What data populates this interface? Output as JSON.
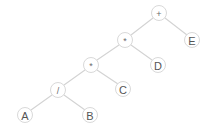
{
  "figure": {
    "kind": "expression-binary-tree",
    "background_color": "#ffffff",
    "edge_color": "#d3d3d3",
    "node_stroke_color": "#d9d9d9",
    "node_fill_color": "#ffffff",
    "label_color": "#5a5a5a",
    "width": 208,
    "height": 132
  },
  "nodes": [
    {
      "id": "n0",
      "label": "+",
      "type": "operator",
      "x": 159,
      "y": 13,
      "r": 7.5
    },
    {
      "id": "n1",
      "label": "*",
      "type": "operator",
      "x": 125,
      "y": 40,
      "r": 7.5
    },
    {
      "id": "n2",
      "label": "E",
      "type": "operand",
      "x": 192,
      "y": 40,
      "r": 7.5
    },
    {
      "id": "n3",
      "label": "*",
      "type": "operator",
      "x": 91,
      "y": 65,
      "r": 7.5
    },
    {
      "id": "n4",
      "label": "D",
      "type": "operand",
      "x": 158,
      "y": 65,
      "r": 7.5
    },
    {
      "id": "n5",
      "label": "/",
      "type": "operator",
      "x": 58,
      "y": 90,
      "r": 7.5
    },
    {
      "id": "n6",
      "label": "C",
      "type": "operand",
      "x": 123,
      "y": 89,
      "r": 7.5
    },
    {
      "id": "n7",
      "label": "A",
      "type": "operand",
      "x": 25,
      "y": 115,
      "r": 7.5
    },
    {
      "id": "n8",
      "label": "B",
      "type": "operand",
      "x": 90,
      "y": 115,
      "r": 7.5
    }
  ],
  "edges": [
    {
      "id": "e0",
      "from": "n0",
      "to": "n1",
      "side": "left",
      "x1": 153,
      "y1": 18,
      "x2": 131,
      "y2": 35
    },
    {
      "id": "e1",
      "from": "n0",
      "to": "n2",
      "side": "right",
      "x1": 165,
      "y1": 18,
      "x2": 187,
      "y2": 35
    },
    {
      "id": "e2",
      "from": "n1",
      "to": "n3",
      "side": "left",
      "x1": 119,
      "y1": 45,
      "x2": 97,
      "y2": 60
    },
    {
      "id": "e3",
      "from": "n1",
      "to": "n4",
      "side": "right",
      "x1": 131,
      "y1": 45,
      "x2": 152,
      "y2": 60
    },
    {
      "id": "e4",
      "from": "n3",
      "to": "n5",
      "side": "left",
      "x1": 85,
      "y1": 70,
      "x2": 64,
      "y2": 85
    },
    {
      "id": "e5",
      "from": "n3",
      "to": "n6",
      "side": "right",
      "x1": 97,
      "y1": 70,
      "x2": 118,
      "y2": 84
    },
    {
      "id": "e6",
      "from": "n5",
      "to": "n7",
      "side": "left",
      "x1": 52,
      "y1": 95,
      "x2": 31,
      "y2": 110
    },
    {
      "id": "e7",
      "from": "n5",
      "to": "n8",
      "side": "right",
      "x1": 64,
      "y1": 95,
      "x2": 85,
      "y2": 110
    }
  ]
}
